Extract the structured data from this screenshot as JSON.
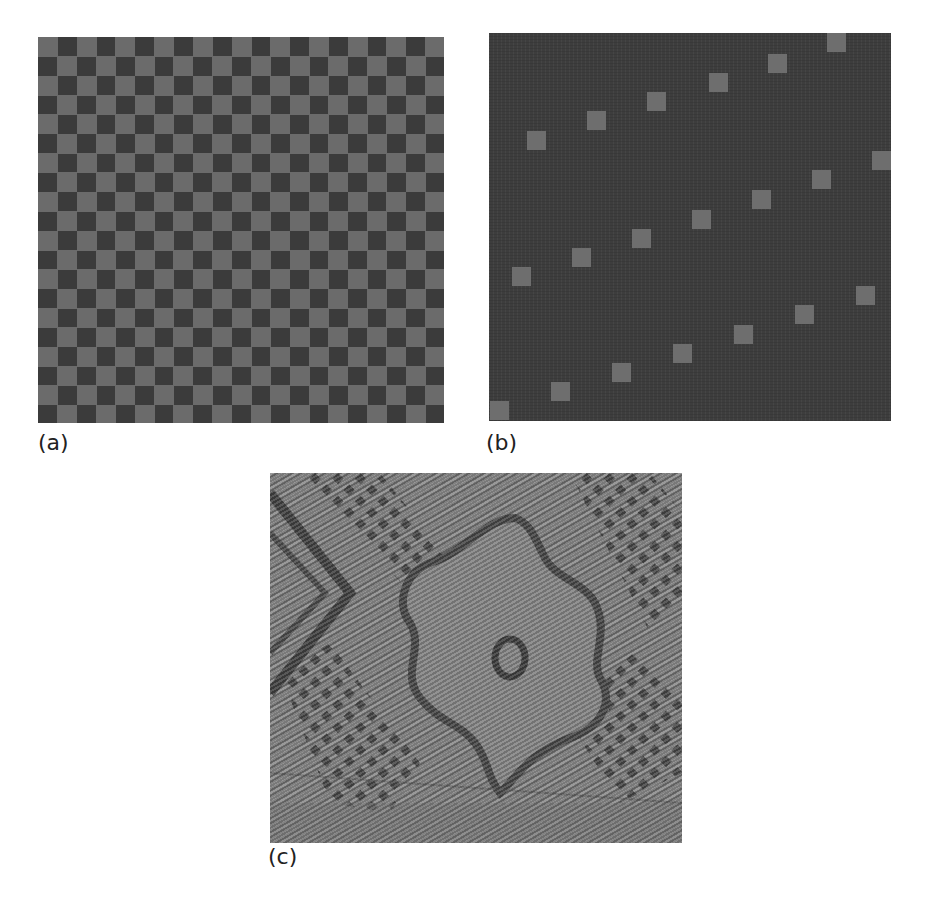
{
  "figure": {
    "panels": [
      {
        "id": "a",
        "label": "(a)",
        "description": "checkerboard pattern",
        "grid": {
          "cols": 21,
          "rows": 20,
          "cell_px": 19.35
        },
        "colors": {
          "light": "#6b6b6b",
          "dark": "#3b3b3b"
        }
      },
      {
        "id": "b",
        "label": "(b)",
        "description": "sparse diagonal square pattern",
        "colors": {
          "background": "#3d3d3d",
          "square": "#6e6e6e"
        },
        "square_size_px": 19,
        "squares": [
          [
            1,
            368
          ],
          [
            62,
            349
          ],
          [
            123,
            330
          ],
          [
            184,
            311
          ],
          [
            245,
            292
          ],
          [
            306,
            272
          ],
          [
            367,
            253
          ],
          [
            23,
            234
          ],
          [
            83,
            215
          ],
          [
            143,
            196
          ],
          [
            203,
            177
          ],
          [
            263,
            157
          ],
          [
            323,
            137
          ],
          [
            383,
            118
          ],
          [
            38,
            98
          ],
          [
            98,
            78
          ],
          [
            158,
            59
          ],
          [
            220,
            40
          ],
          [
            279,
            21
          ],
          [
            338,
            0
          ]
        ]
      },
      {
        "id": "c",
        "label": "(c)",
        "description": "woven fabric texture with floral motif"
      }
    ]
  }
}
